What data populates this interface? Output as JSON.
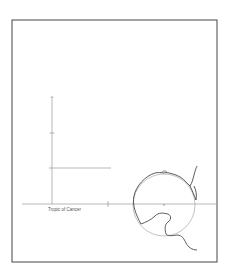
{
  "diagram": {
    "frame": {
      "x": 12,
      "y": 20,
      "width": 205,
      "height": 242,
      "stroke": "#444444"
    },
    "labels": {
      "tropic": "Tropic of Cancer"
    },
    "horizontal_axis": {
      "x1": 22,
      "x2": 216,
      "y": 204
    },
    "vertical_axis": {
      "x": 52,
      "y1": 97,
      "y2": 204
    },
    "horizontal_marker": {
      "x1": 49,
      "x2": 111,
      "y": 168
    },
    "circle": {
      "cx": 164,
      "cy": 205,
      "r": 31
    },
    "colors": {
      "line": "#888888",
      "dark_line": "#333333",
      "frame": "#444444"
    }
  }
}
